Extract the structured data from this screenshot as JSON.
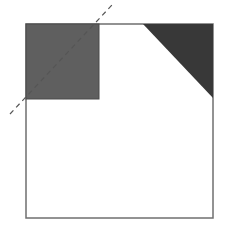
{
  "diagram": {
    "outer_square": {
      "x": 26,
      "y": 24,
      "width": 187,
      "height": 194,
      "stroke": "#6f6f6f",
      "fill": "#ffffff"
    },
    "gray_square": {
      "x": 26,
      "y": 24,
      "width": 73,
      "height": 75,
      "fill": "#5f5f5f",
      "stroke": "#4a4a4a"
    },
    "corner_triangle": {
      "points": "143,24 213,24 213,98",
      "fill": "#383838"
    },
    "dashed_line": {
      "x1": 10,
      "y1": 114,
      "x2": 112,
      "y2": 5,
      "stroke": "#555555",
      "dash": "5,4"
    }
  }
}
